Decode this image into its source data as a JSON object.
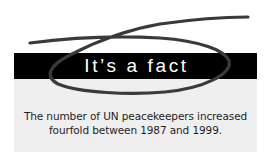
{
  "callout": {
    "title": "It’s a fact",
    "text_line1": "The number of UN peacekeepers increased",
    "text_line2": "fourfold between 1987 and 1999.",
    "colors": {
      "banner": "#000000",
      "banner_text": "#ffffff",
      "box": "#efefef",
      "body_text": "#1e1e1e",
      "scribble": "#3a3a3a"
    }
  }
}
